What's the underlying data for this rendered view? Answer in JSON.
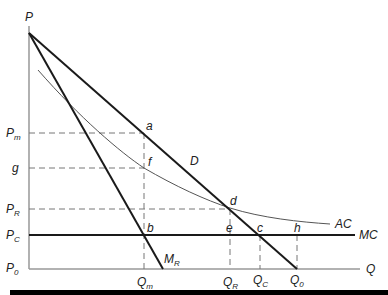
{
  "diagram": {
    "axes": {
      "y_label": "P",
      "x_label": "Q"
    },
    "curves": {
      "demand": "D",
      "marginal_revenue": {
        "main": "M",
        "sub": "R"
      },
      "average_cost": "AC",
      "marginal_cost": "MC"
    },
    "price_levels": [
      {
        "main": "P",
        "sub": "m"
      },
      {
        "main": "g",
        "sub": ""
      },
      {
        "main": "P",
        "sub": "R"
      },
      {
        "main": "P",
        "sub": "C"
      },
      {
        "main": "P",
        "sub": "0"
      }
    ],
    "quantity_levels": [
      {
        "main": "Q",
        "sub": "m"
      },
      {
        "main": "Q",
        "sub": "R"
      },
      {
        "main": "Q",
        "sub": "C"
      },
      {
        "main": "Q",
        "sub": "0"
      }
    ],
    "points": [
      "a",
      "f",
      "d",
      "b",
      "e",
      "c",
      "h"
    ],
    "colors": {
      "curve": "#1a1a1a",
      "ac_curve": "#555555",
      "dashed": "#777777",
      "axis": "#888888",
      "bar": "#000000"
    }
  }
}
